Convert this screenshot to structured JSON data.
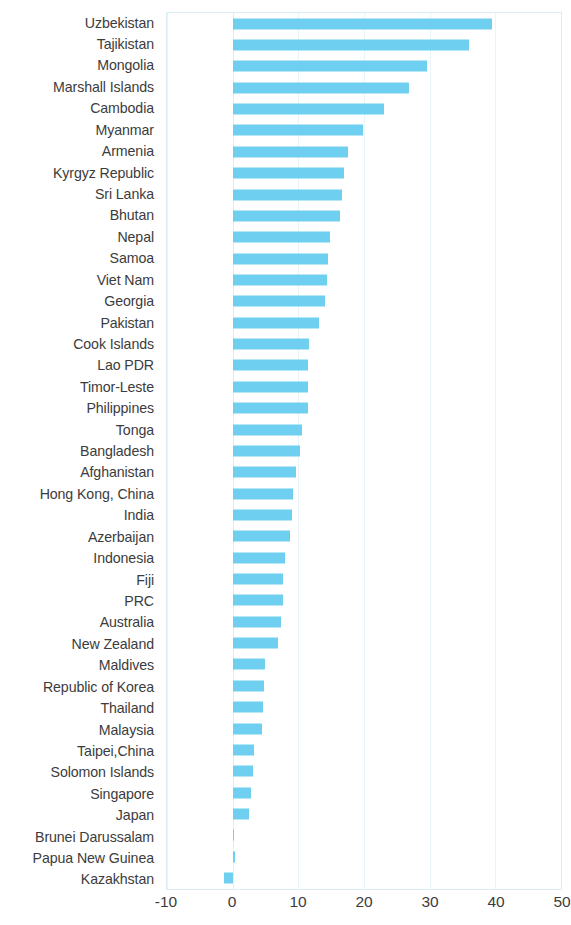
{
  "chart_data": {
    "type": "bar",
    "orientation": "horizontal",
    "title": "",
    "subtitle": "",
    "xlabel": "",
    "ylabel": "",
    "xlim": [
      -10,
      50
    ],
    "ylim": null,
    "grid": true,
    "legend": null,
    "bar_color": "#6ecff0",
    "axis_tick_labels": [
      "-10",
      "0",
      "10",
      "20",
      "30",
      "40",
      "50"
    ],
    "axis_ticks": [
      -10,
      0,
      10,
      20,
      30,
      40,
      50
    ],
    "categories": [
      "Uzbekistan",
      "Tajikistan",
      "Mongolia",
      "Marshall Islands",
      "Cambodia",
      "Myanmar",
      "Armenia",
      "Kyrgyz Republic",
      "Sri Lanka",
      "Bhutan",
      "Nepal",
      "Samoa",
      "Viet Nam",
      "Georgia",
      "Pakistan",
      "Cook Islands",
      "Lao PDR",
      "Timor-Leste",
      "Philippines",
      "Tonga",
      "Bangladesh",
      "Afghanistan",
      "Hong Kong, China",
      "India",
      "Azerbaijan",
      "Indonesia",
      "Fiji",
      "PRC",
      "Australia",
      "New Zealand",
      "Maldives",
      "Republic of Korea",
      "Thailand",
      "Malaysia",
      "Taipei,China",
      "Solomon Islands",
      "Singapore",
      "Japan",
      "Brunei Darussalam",
      "Papua New Guinea",
      "Kazakhstan"
    ],
    "values": [
      39.5,
      36.0,
      29.6,
      26.9,
      23.0,
      19.9,
      17.6,
      16.9,
      16.7,
      16.4,
      14.9,
      14.5,
      14.3,
      14.0,
      13.1,
      11.6,
      11.5,
      11.4,
      11.4,
      10.6,
      10.3,
      9.6,
      9.2,
      9.0,
      8.7,
      7.9,
      7.7,
      7.6,
      7.4,
      6.9,
      4.9,
      4.8,
      4.6,
      4.4,
      3.3,
      3.1,
      2.8,
      2.5,
      0.2,
      0.3,
      -1.3
    ]
  }
}
